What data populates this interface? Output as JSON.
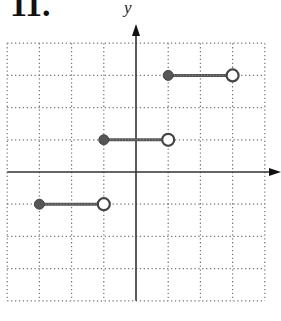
{
  "title": "11.",
  "chart_data": {
    "type": "line",
    "title": "",
    "xlabel": "",
    "ylabel": "y",
    "xlim": [
      -4,
      4
    ],
    "ylim": [
      -4,
      4
    ],
    "grid": true,
    "grid_style": "dotted",
    "series": [
      {
        "name": "segment-1",
        "x": [
          -3,
          -1
        ],
        "y": [
          -1,
          -1
        ],
        "start": "closed",
        "end": "open"
      },
      {
        "name": "segment-2",
        "x": [
          -1,
          1
        ],
        "y": [
          1,
          1
        ],
        "start": "closed",
        "end": "open"
      },
      {
        "name": "segment-3",
        "x": [
          1,
          3
        ],
        "y": [
          3,
          3
        ],
        "start": "closed",
        "end": "open"
      }
    ],
    "colors": {
      "line": "#555555",
      "axis": "#333333",
      "grid": "#777777"
    }
  }
}
